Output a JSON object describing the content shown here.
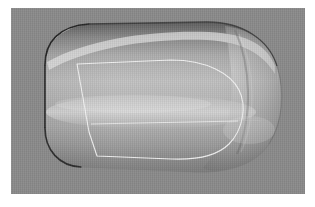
{
  "figure": {
    "kind": "3d-surface-render",
    "subject_label": "vehicle-body-shell",
    "view": "side three-quarter",
    "caption": "",
    "background_color": "#8a8a8a",
    "body_base_color": "#a9a9a9",
    "body_highlight_color": "#d7d7d7",
    "body_shadow_color": "#6f6f6f",
    "outline_dark_color": "#2b2b2b",
    "wireframe_color": "#f2f2f2",
    "canvas": {
      "width": 315,
      "height": 207
    },
    "viewport": {
      "x": 11,
      "y": 8,
      "width": 294,
      "height": 186
    }
  },
  "geometry": {
    "body_outline_name": "body-silhouette",
    "body_path": "M 34 57 C 34 34, 48 18, 78 16 L 196 14 C 232 14, 258 32, 266 58 C 274 84, 272 114, 258 136 C 244 158, 214 166, 180 164 L 70 159 C 48 158, 34 142, 34 120 Z",
    "panel_outline_name": "door-panel-wireframe",
    "panel_path": "M 66 56 L 160 52 C 196 52, 220 66, 228 82 C 236 98, 232 122, 218 136 C 206 148, 184 152, 160 151 L 86 148 L 78 124 Z",
    "panel_belt_line_name": "panel-belt-line",
    "panel_belt_path": "M 80 116 L 226 114",
    "crease_highlight_name": "upper-crease-highlight",
    "crease_path": "M 40 46 C 84 26, 150 20, 198 22 C 236 24, 254 36, 262 54",
    "dome_seam_name": "nose-dome-seam",
    "dome_seam_path": "M 226 24 C 240 56, 242 104, 228 142"
  },
  "annotations": {
    "has_axes": false,
    "has_legend": false,
    "has_text_labels": false,
    "label_count": 0
  }
}
